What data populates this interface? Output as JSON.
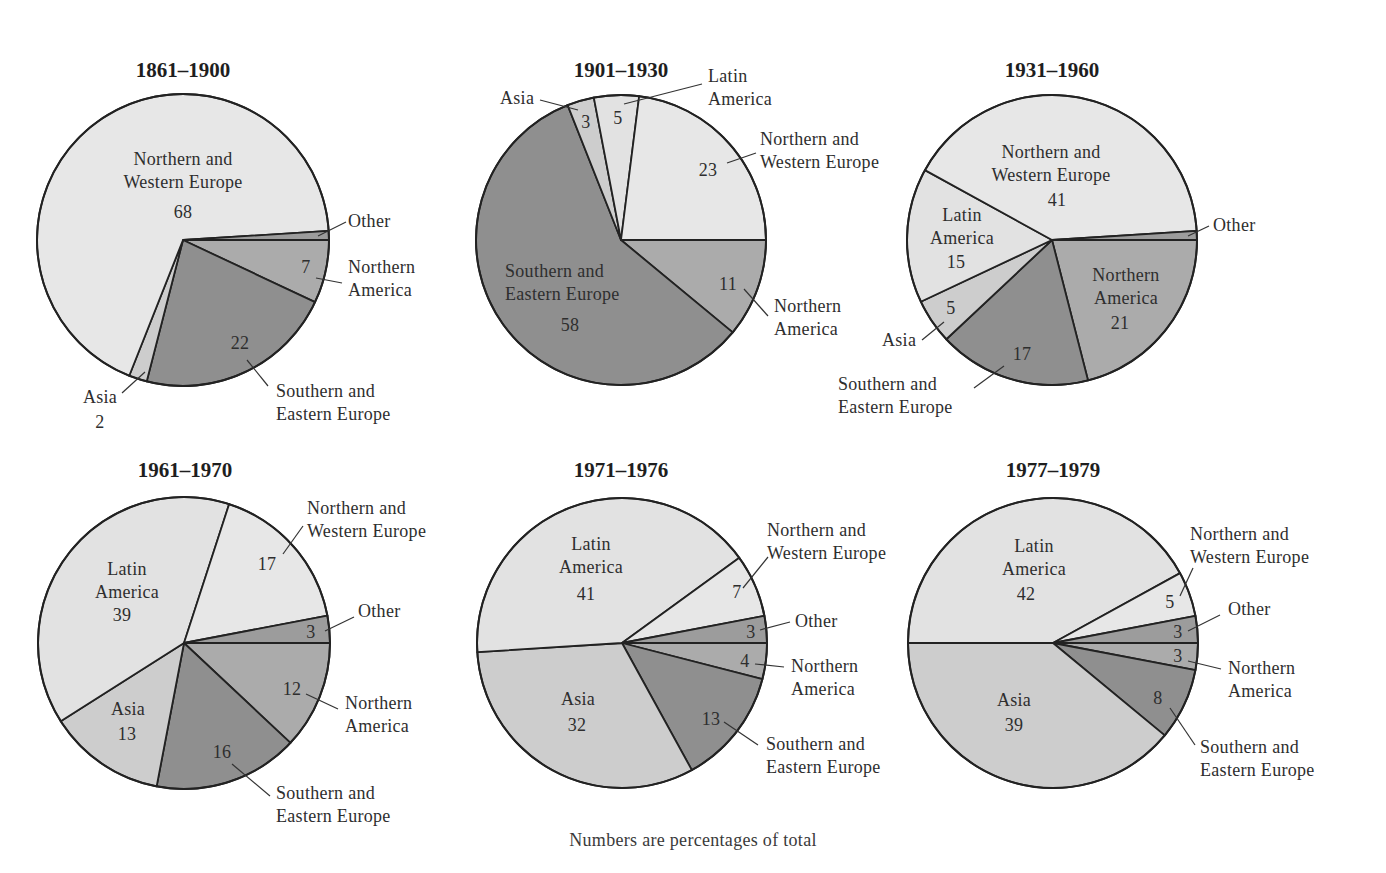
{
  "caption": "Numbers are percentages of total",
  "colors": {
    "Northern and Western Europe": "#e7e7e7",
    "Latin America": "#e2e2e2",
    "Asia": "#cdcdcd",
    "Northern America": "#ababab",
    "Southern and Eastern Europe": "#8f8f8f",
    "Other": "#9c9c9c",
    "stroke": "#222222"
  },
  "chart_data": [
    {
      "type": "pie",
      "title": "1861–1900",
      "categories": [
        "Northern America",
        "Southern and Eastern Europe",
        "Asia",
        "Northern and Western Europe",
        "Other"
      ],
      "values": [
        7,
        22,
        2,
        68,
        1
      ],
      "center": [
        183,
        240
      ],
      "radius": 146,
      "title_pos": [
        183,
        77
      ],
      "labels": [
        {
          "lines": [
            "Northern and",
            "Western Europe"
          ],
          "x": 183,
          "y": 165,
          "anchor": "middle"
        },
        {
          "lines": [
            "68"
          ],
          "x": 183,
          "y": 218,
          "anchor": "middle"
        },
        {
          "lines": [
            "Other"
          ],
          "x": 348,
          "y": 227,
          "anchor": "start"
        },
        {
          "lines": [
            "7"
          ],
          "x": 306,
          "y": 273,
          "anchor": "middle"
        },
        {
          "lines": [
            "Northern",
            "America"
          ],
          "x": 348,
          "y": 273,
          "anchor": "start"
        },
        {
          "lines": [
            "22"
          ],
          "x": 240,
          "y": 349,
          "anchor": "middle"
        },
        {
          "lines": [
            "Southern and",
            "Eastern Europe"
          ],
          "x": 276,
          "y": 397,
          "anchor": "start"
        },
        {
          "lines": [
            "Asia"
          ],
          "x": 100,
          "y": 403,
          "anchor": "middle"
        },
        {
          "lines": [
            "2"
          ],
          "x": 100,
          "y": 428,
          "anchor": "middle"
        }
      ],
      "leaders": [
        [
          318,
          236,
          346,
          222
        ],
        [
          316,
          278,
          342,
          283
        ],
        [
          247,
          360,
          268,
          386
        ],
        [
          145,
          372,
          122,
          393
        ]
      ]
    },
    {
      "type": "pie",
      "title": "1901–1930",
      "categories": [
        "Northern America",
        "Southern and Eastern Europe",
        "Asia",
        "Latin America",
        "Northern and Western Europe"
      ],
      "values": [
        11,
        58,
        3,
        5,
        23
      ],
      "center": [
        621,
        240
      ],
      "radius": 145,
      "title_pos": [
        621,
        77
      ],
      "labels": [
        {
          "lines": [
            "Latin",
            "America"
          ],
          "x": 708,
          "y": 82,
          "anchor": "start"
        },
        {
          "lines": [
            "Asia"
          ],
          "x": 500,
          "y": 104,
          "anchor": "start"
        },
        {
          "lines": [
            "3"
          ],
          "x": 586,
          "y": 128,
          "anchor": "middle"
        },
        {
          "lines": [
            "5"
          ],
          "x": 618,
          "y": 124,
          "anchor": "middle"
        },
        {
          "lines": [
            "Northern and",
            "Western Europe"
          ],
          "x": 760,
          "y": 145,
          "anchor": "start"
        },
        {
          "lines": [
            "23"
          ],
          "x": 708,
          "y": 176,
          "anchor": "middle"
        },
        {
          "lines": [
            "Southern and",
            "Eastern Europe"
          ],
          "x": 505,
          "y": 277,
          "anchor": "start"
        },
        {
          "lines": [
            "58"
          ],
          "x": 570,
          "y": 331,
          "anchor": "middle"
        },
        {
          "lines": [
            "11"
          ],
          "x": 728,
          "y": 290,
          "anchor": "middle"
        },
        {
          "lines": [
            "Northern",
            "America"
          ],
          "x": 774,
          "y": 312,
          "anchor": "start"
        }
      ],
      "leaders": [
        [
          624,
          104,
          702,
          84
        ],
        [
          540,
          100,
          578,
          110
        ],
        [
          727,
          163,
          756,
          153
        ],
        [
          744,
          289,
          768,
          316
        ]
      ]
    },
    {
      "type": "pie",
      "title": "1931–1960",
      "categories": [
        "Northern America",
        "Southern and Eastern Europe",
        "Asia",
        "Latin America",
        "Northern and Western Europe",
        "Other"
      ],
      "values": [
        21,
        17,
        5,
        15,
        41,
        1
      ],
      "center": [
        1052,
        240
      ],
      "radius": 145,
      "title_pos": [
        1052,
        77
      ],
      "labels": [
        {
          "lines": [
            "Northern and",
            "Western Europe"
          ],
          "x": 1051,
          "y": 158,
          "anchor": "middle"
        },
        {
          "lines": [
            "41"
          ],
          "x": 1057,
          "y": 206,
          "anchor": "middle"
        },
        {
          "lines": [
            "Latin",
            "America"
          ],
          "x": 962,
          "y": 221,
          "anchor": "middle"
        },
        {
          "lines": [
            "15"
          ],
          "x": 956,
          "y": 268,
          "anchor": "middle"
        },
        {
          "lines": [
            "Other"
          ],
          "x": 1213,
          "y": 231,
          "anchor": "start"
        },
        {
          "lines": [
            "Northern",
            "America"
          ],
          "x": 1126,
          "y": 281,
          "anchor": "middle"
        },
        {
          "lines": [
            "21"
          ],
          "x": 1120,
          "y": 329,
          "anchor": "middle"
        },
        {
          "lines": [
            "5"
          ],
          "x": 951,
          "y": 314,
          "anchor": "middle"
        },
        {
          "lines": [
            "Asia"
          ],
          "x": 882,
          "y": 346,
          "anchor": "start"
        },
        {
          "lines": [
            "17"
          ],
          "x": 1022,
          "y": 360,
          "anchor": "middle"
        },
        {
          "lines": [
            "Southern and",
            "Eastern Europe"
          ],
          "x": 838,
          "y": 390,
          "anchor": "start"
        },
        {
          "lines": [
            "Other_leader_pad"
          ],
          "x": -999,
          "y": -999,
          "anchor": "start"
        }
      ],
      "leaders": [
        [
          1188,
          236,
          1209,
          226
        ],
        [
          944,
          322,
          922,
          340
        ],
        [
          1004,
          366,
          974,
          388
        ]
      ]
    },
    {
      "type": "pie",
      "title": "1961–1970",
      "categories": [
        "Northern America",
        "Southern and Eastern Europe",
        "Asia",
        "Latin America",
        "Northern and Western Europe",
        "Other"
      ],
      "values": [
        12,
        16,
        13,
        39,
        17,
        3
      ],
      "center": [
        184,
        643
      ],
      "radius": 146,
      "title_pos": [
        185,
        477
      ],
      "labels": [
        {
          "lines": [
            "Northern and",
            "Western Europe"
          ],
          "x": 307,
          "y": 514,
          "anchor": "start"
        },
        {
          "lines": [
            "Latin",
            "America"
          ],
          "x": 127,
          "y": 575,
          "anchor": "middle"
        },
        {
          "lines": [
            "39"
          ],
          "x": 122,
          "y": 621,
          "anchor": "middle"
        },
        {
          "lines": [
            "17"
          ],
          "x": 267,
          "y": 570,
          "anchor": "middle"
        },
        {
          "lines": [
            "Other"
          ],
          "x": 358,
          "y": 617,
          "anchor": "start"
        },
        {
          "lines": [
            "3"
          ],
          "x": 311,
          "y": 638,
          "anchor": "middle"
        },
        {
          "lines": [
            "12"
          ],
          "x": 292,
          "y": 695,
          "anchor": "middle"
        },
        {
          "lines": [
            "Northern",
            "America"
          ],
          "x": 345,
          "y": 709,
          "anchor": "start"
        },
        {
          "lines": [
            "Asia"
          ],
          "x": 128,
          "y": 715,
          "anchor": "middle"
        },
        {
          "lines": [
            "13"
          ],
          "x": 127,
          "y": 740,
          "anchor": "middle"
        },
        {
          "lines": [
            "16"
          ],
          "x": 222,
          "y": 758,
          "anchor": "middle"
        },
        {
          "lines": [
            "Southern and",
            "Eastern Europe"
          ],
          "x": 276,
          "y": 799,
          "anchor": "start"
        }
      ],
      "leaders": [
        [
          283,
          554,
          303,
          526
        ],
        [
          325,
          631,
          354,
          617
        ],
        [
          306,
          694,
          338,
          709
        ],
        [
          232,
          764,
          270,
          796
        ]
      ]
    },
    {
      "type": "pie",
      "title": "1971–1976",
      "categories": [
        "Northern America",
        "Southern and Eastern Europe",
        "Asia",
        "Latin America",
        "Northern and Western Europe",
        "Other"
      ],
      "values": [
        4,
        13,
        32,
        41,
        7,
        3
      ],
      "center": [
        622,
        643
      ],
      "radius": 145,
      "title_pos": [
        621,
        477
      ],
      "labels": [
        {
          "lines": [
            "Northern and",
            "Western Europe"
          ],
          "x": 767,
          "y": 536,
          "anchor": "start"
        },
        {
          "lines": [
            "Latin",
            "America"
          ],
          "x": 591,
          "y": 550,
          "anchor": "middle"
        },
        {
          "lines": [
            "41"
          ],
          "x": 586,
          "y": 600,
          "anchor": "middle"
        },
        {
          "lines": [
            "7"
          ],
          "x": 737,
          "y": 598,
          "anchor": "middle"
        },
        {
          "lines": [
            "Other"
          ],
          "x": 795,
          "y": 627,
          "anchor": "start"
        },
        {
          "lines": [
            "3"
          ],
          "x": 751,
          "y": 638,
          "anchor": "middle"
        },
        {
          "lines": [
            "4"
          ],
          "x": 745,
          "y": 667,
          "anchor": "middle"
        },
        {
          "lines": [
            "Northern",
            "America"
          ],
          "x": 791,
          "y": 672,
          "anchor": "start"
        },
        {
          "lines": [
            "Asia"
          ],
          "x": 578,
          "y": 705,
          "anchor": "middle"
        },
        {
          "lines": [
            "32"
          ],
          "x": 577,
          "y": 731,
          "anchor": "middle"
        },
        {
          "lines": [
            "13"
          ],
          "x": 711,
          "y": 725,
          "anchor": "middle"
        },
        {
          "lines": [
            "Southern and",
            "Eastern Europe"
          ],
          "x": 766,
          "y": 750,
          "anchor": "start"
        }
      ],
      "leaders": [
        [
          743,
          588,
          768,
          557
        ],
        [
          760,
          630,
          790,
          622
        ],
        [
          755,
          664,
          784,
          667
        ],
        [
          724,
          722,
          758,
          745
        ]
      ]
    },
    {
      "type": "pie",
      "title": "1977–1979",
      "categories": [
        "Northern America",
        "Southern and Eastern Europe",
        "Asia",
        "Latin America",
        "Northern and Western Europe",
        "Other"
      ],
      "values": [
        3,
        8,
        39,
        42,
        5,
        3
      ],
      "center": [
        1053,
        643
      ],
      "radius": 145,
      "title_pos": [
        1053,
        477
      ],
      "labels": [
        {
          "lines": [
            "Northern and",
            "Western Europe"
          ],
          "x": 1190,
          "y": 540,
          "anchor": "start"
        },
        {
          "lines": [
            "Latin",
            "America"
          ],
          "x": 1034,
          "y": 552,
          "anchor": "middle"
        },
        {
          "lines": [
            "42"
          ],
          "x": 1026,
          "y": 600,
          "anchor": "middle"
        },
        {
          "lines": [
            "5"
          ],
          "x": 1170,
          "y": 608,
          "anchor": "middle"
        },
        {
          "lines": [
            "Other"
          ],
          "x": 1228,
          "y": 615,
          "anchor": "start"
        },
        {
          "lines": [
            "3"
          ],
          "x": 1178,
          "y": 638,
          "anchor": "middle"
        },
        {
          "lines": [
            "3"
          ],
          "x": 1178,
          "y": 662,
          "anchor": "middle"
        },
        {
          "lines": [
            "Northern",
            "America"
          ],
          "x": 1228,
          "y": 674,
          "anchor": "start"
        },
        {
          "lines": [
            "Asia"
          ],
          "x": 1014,
          "y": 706,
          "anchor": "middle"
        },
        {
          "lines": [
            "39"
          ],
          "x": 1014,
          "y": 731,
          "anchor": "middle"
        },
        {
          "lines": [
            "8"
          ],
          "x": 1158,
          "y": 704,
          "anchor": "middle"
        },
        {
          "lines": [
            "Southern and",
            "Eastern Europe"
          ],
          "x": 1200,
          "y": 753,
          "anchor": "start"
        }
      ],
      "leaders": [
        [
          1180,
          596,
          1193,
          568
        ],
        [
          1188,
          631,
          1220,
          615
        ],
        [
          1188,
          661,
          1221,
          669
        ],
        [
          1170,
          708,
          1195,
          745
        ]
      ]
    }
  ]
}
